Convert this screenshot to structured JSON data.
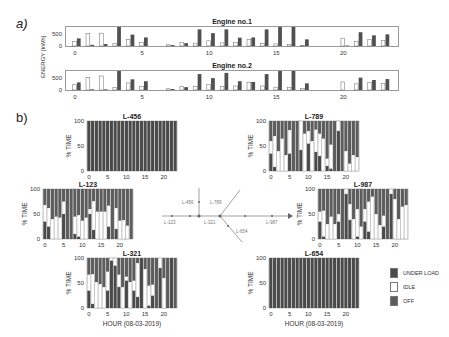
{
  "panels": {
    "a_label": "a)",
    "b_label": "b)"
  },
  "colors": {
    "under_load": "#4a4a4a",
    "idle": "#ffffff",
    "off": "#5c5c5c",
    "energy_dark": "#505050",
    "energy_light": "#ffffff",
    "frame": "#9a9a9a"
  },
  "chart_data": [
    {
      "type": "bar",
      "title": "Engine no.1",
      "xlabel": "",
      "ylabel": "ENERGY [kWh]",
      "x": [
        0,
        1,
        2,
        3,
        4,
        5,
        6,
        7,
        8,
        9,
        10,
        11,
        12,
        13,
        14,
        15,
        16,
        17,
        18,
        19,
        20,
        21,
        22,
        23
      ],
      "xticks": [
        0,
        5,
        10,
        15,
        20
      ],
      "yticks": [
        0,
        500
      ],
      "ylim": [
        0,
        800
      ],
      "series": [
        {
          "name": "light",
          "values": [
            200,
            530,
            540,
            100,
            280,
            140,
            0,
            50,
            140,
            120,
            220,
            130,
            150,
            270,
            110,
            90,
            70,
            20,
            0,
            0,
            330,
            200,
            280,
            240
          ]
        },
        {
          "name": "dark",
          "values": [
            320,
            50,
            80,
            800,
            480,
            360,
            0,
            40,
            120,
            700,
            540,
            700,
            350,
            360,
            700,
            800,
            800,
            280,
            0,
            0,
            20,
            580,
            450,
            490
          ]
        }
      ]
    },
    {
      "type": "bar",
      "title": "Engine no.2",
      "xlabel": "",
      "ylabel": "ENERGY [kWh]",
      "x": [
        0,
        1,
        2,
        3,
        4,
        5,
        6,
        7,
        8,
        9,
        10,
        11,
        12,
        13,
        14,
        15,
        16,
        17,
        18,
        19,
        20,
        21,
        22,
        23
      ],
      "xticks": [
        0,
        5,
        10,
        15,
        20
      ],
      "yticks": [
        0,
        500
      ],
      "ylim": [
        0,
        800
      ],
      "series": [
        {
          "name": "light",
          "values": [
            220,
            530,
            590,
            100,
            300,
            150,
            0,
            50,
            150,
            160,
            240,
            150,
            170,
            310,
            170,
            120,
            100,
            60,
            0,
            0,
            340,
            260,
            320,
            280
          ]
        },
        {
          "name": "dark",
          "values": [
            320,
            30,
            30,
            800,
            450,
            370,
            0,
            40,
            120,
            670,
            500,
            720,
            370,
            340,
            670,
            800,
            800,
            280,
            0,
            0,
            0,
            520,
            420,
            460
          ]
        }
      ]
    },
    {
      "type": "bar",
      "stacked": true,
      "title": "L-456",
      "ylabel": "% TIME",
      "xticks": [
        0,
        5,
        10,
        15,
        20
      ],
      "yticks": [
        0,
        50,
        100
      ],
      "ylim": [
        0,
        100
      ],
      "series_order": [
        "UNDER LOAD",
        "IDLE",
        "OFF"
      ],
      "under_load": [
        100,
        100,
        100,
        100,
        100,
        100,
        100,
        100,
        100,
        100,
        100,
        100,
        100,
        100,
        100,
        100,
        100,
        100,
        100,
        100,
        100,
        100,
        100,
        100
      ],
      "idle": [
        0,
        0,
        0,
        0,
        0,
        0,
        0,
        0,
        0,
        0,
        0,
        0,
        0,
        0,
        0,
        0,
        0,
        0,
        0,
        0,
        0,
        0,
        0,
        0
      ]
    },
    {
      "type": "bar",
      "stacked": true,
      "title": "L-789",
      "ylabel": "% TIME",
      "xticks": [
        0,
        5,
        10,
        15,
        20
      ],
      "yticks": [
        0,
        50,
        100
      ],
      "ylim": [
        0,
        100
      ],
      "under_load": [
        35,
        8,
        0,
        0,
        0,
        35,
        0,
        0,
        42,
        0,
        55,
        0,
        38,
        30,
        0,
        10,
        5,
        0,
        80,
        0,
        0,
        0,
        0,
        0
      ],
      "idle": [
        25,
        62,
        40,
        65,
        32,
        47,
        0,
        0,
        58,
        75,
        25,
        60,
        45,
        45,
        65,
        15,
        48,
        0,
        20,
        0,
        40,
        15,
        32,
        28
      ]
    },
    {
      "type": "bar",
      "stacked": true,
      "title": "L-123",
      "ylabel": "% TIME",
      "xticks": [
        0,
        5,
        10,
        15,
        20
      ],
      "yticks": [
        0,
        50,
        100
      ],
      "ylim": [
        0,
        100
      ],
      "under_load": [
        35,
        25,
        0,
        0,
        0,
        50,
        0,
        0,
        10,
        5,
        0,
        0,
        50,
        18,
        0,
        0,
        0,
        25,
        0,
        20,
        0,
        0,
        0,
        0
      ],
      "idle": [
        33,
        37,
        40,
        45,
        43,
        25,
        0,
        0,
        35,
        43,
        37,
        43,
        10,
        58,
        55,
        55,
        55,
        42,
        0,
        42,
        37,
        38,
        27,
        0
      ]
    },
    {
      "type": "bar",
      "stacked": true,
      "title": "L-987",
      "ylabel": "% TIME",
      "xticks": [
        0,
        5,
        10,
        15,
        20
      ],
      "yticks": [
        0,
        50,
        100
      ],
      "ylim": [
        0,
        100
      ],
      "under_load": [
        35,
        5,
        0,
        0,
        0,
        35,
        0,
        90,
        38,
        0,
        5,
        0,
        35,
        15,
        0,
        0,
        0,
        25,
        0,
        90,
        0,
        0,
        0,
        0
      ],
      "idle": [
        20,
        52,
        30,
        45,
        30,
        15,
        0,
        10,
        32,
        40,
        55,
        25,
        25,
        60,
        85,
        50,
        28,
        22,
        0,
        10,
        80,
        40,
        65,
        68
      ]
    },
    {
      "type": "bar",
      "stacked": true,
      "title": "L-321",
      "ylabel": "% TIME",
      "xlabel": "HOUR (08-03-2019)",
      "xticks": [
        0,
        5,
        10,
        15,
        20
      ],
      "yticks": [
        0,
        50,
        100
      ],
      "ylim": [
        0,
        100
      ],
      "under_load": [
        35,
        8,
        0,
        0,
        0,
        35,
        95,
        85,
        42,
        0,
        55,
        0,
        35,
        22,
        100,
        0,
        5,
        25,
        0,
        80,
        0,
        0,
        100,
        0
      ],
      "idle": [
        32,
        60,
        52,
        48,
        42,
        38,
        5,
        15,
        25,
        42,
        8,
        52,
        20,
        68,
        0,
        78,
        40,
        22,
        0,
        20,
        60,
        0,
        0,
        0
      ]
    },
    {
      "type": "bar",
      "stacked": true,
      "title": "L-654",
      "ylabel": "% TIME",
      "xlabel": "HOUR (08-03-2019)",
      "xticks": [
        0,
        5,
        10,
        15,
        20
      ],
      "yticks": [
        0,
        50,
        100
      ],
      "ylim": [
        0,
        100
      ],
      "under_load": [
        100,
        100,
        100,
        100,
        100,
        100,
        100,
        100,
        100,
        100,
        100,
        100,
        100,
        100,
        100,
        100,
        100,
        100,
        100,
        100,
        100,
        100,
        100,
        100
      ],
      "idle": [
        0,
        0,
        0,
        0,
        0,
        0,
        0,
        0,
        0,
        0,
        0,
        0,
        0,
        0,
        0,
        0,
        0,
        0,
        0,
        0,
        0,
        0,
        0,
        0
      ]
    }
  ],
  "legend": [
    {
      "label": "UNDER LOAD",
      "color": "#4a4a4a"
    },
    {
      "label": "IDLE",
      "color": "#ffffff"
    },
    {
      "label": "OFF",
      "color": "#5c5c5c"
    }
  ],
  "network": {
    "labels": [
      "L-456",
      "L-789",
      "L-123",
      "L-321",
      "L-654",
      "L-987"
    ]
  }
}
